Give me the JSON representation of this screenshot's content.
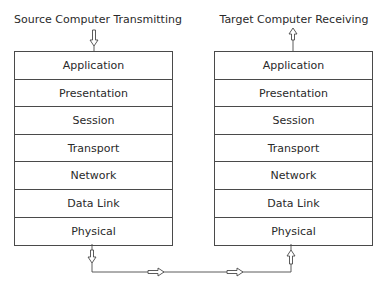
{
  "source": {
    "title": "Source Computer Transmitting",
    "layers": [
      "Application",
      "Presentation",
      "Session",
      "Transport",
      "Network",
      "Data Link",
      "Physical"
    ]
  },
  "target": {
    "title": "Target Computer Receiving",
    "layers": [
      "Application",
      "Presentation",
      "Session",
      "Transport",
      "Network",
      "Data Link",
      "Physical"
    ]
  },
  "colors": {
    "line": "#4a4a4a",
    "text": "#2a2a2a",
    "background": "#ffffff"
  }
}
